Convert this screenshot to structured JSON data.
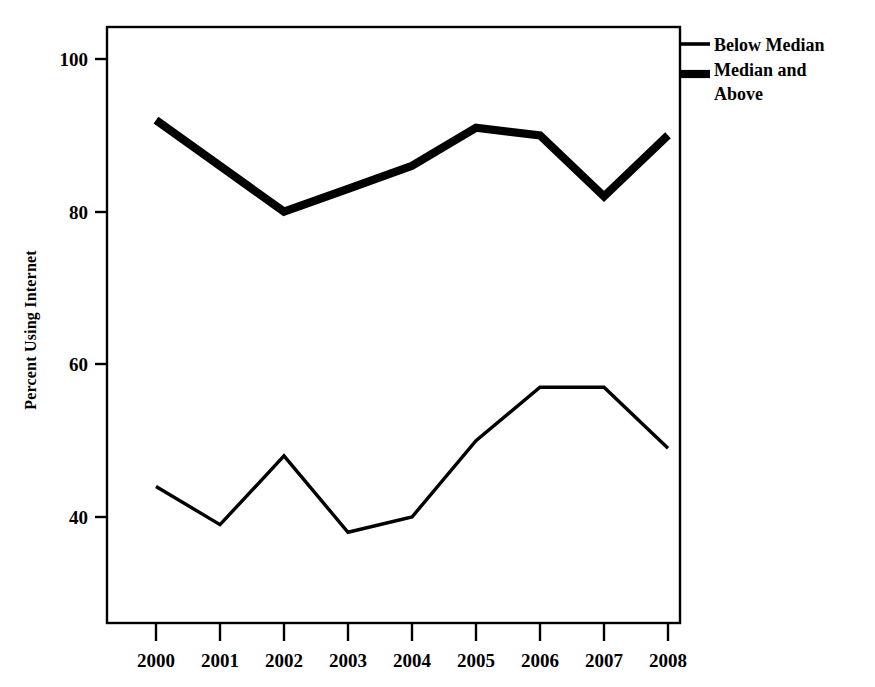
{
  "chart_data": {
    "type": "line",
    "title": "",
    "xlabel": "",
    "ylabel": "Percent Using Internet",
    "categories": [
      "2000",
      "2001",
      "2002",
      "2003",
      "2004",
      "2005",
      "2006",
      "2007",
      "2008"
    ],
    "x": [
      2000,
      2001,
      2002,
      2003,
      2004,
      2005,
      2006,
      2007,
      2008
    ],
    "series": [
      {
        "name": "Below Median",
        "style": "thin",
        "values": [
          44,
          39,
          48,
          38,
          40,
          50,
          57,
          57,
          49
        ]
      },
      {
        "name": "Median and Above",
        "style": "thick",
        "values": [
          92,
          86,
          80,
          83,
          86,
          91,
          90,
          82,
          90
        ]
      }
    ],
    "ylim": [
      28,
      105
    ],
    "xlim": [
      1999.2,
      2008.2
    ],
    "yticks": [
      40,
      60,
      80,
      100
    ],
    "ytick_labels": [
      "40",
      "60",
      "80",
      "100"
    ],
    "grid": false,
    "legend_position": "right-top",
    "frame": true,
    "colors": {
      "line": "#000000",
      "axis": "#000000",
      "background": "#ffffff"
    }
  },
  "axes": {
    "y_title": "Percent Using Internet",
    "y_tick_labels": [
      "100",
      "80",
      "60",
      "40"
    ],
    "x_tick_labels": [
      "2000",
      "2001",
      "2002",
      "2003",
      "2004",
      "2005",
      "2006",
      "2007",
      "2008"
    ]
  },
  "legend": {
    "entries": [
      {
        "label": "Below Median",
        "label_line1": "Below Median",
        "label_line2": "",
        "swatch": "thin-line-swatch"
      },
      {
        "label": "Median and Above",
        "label_line1": "Median and",
        "label_line2": "Above",
        "swatch": "thick-line-swatch"
      }
    ]
  }
}
